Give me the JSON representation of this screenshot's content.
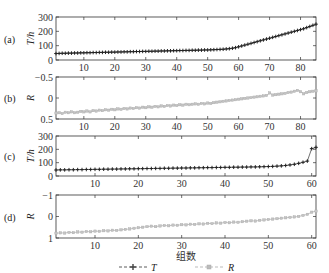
{
  "chart_data": [
    {
      "id": "a",
      "type": "line",
      "panel_label": "(a)",
      "ylabel": "T/h",
      "xlabel": "",
      "xlim": [
        1,
        85
      ],
      "ylim": [
        0,
        300
      ],
      "yticks": [
        "0",
        "100",
        "200",
        "300"
      ],
      "ytick_values": [
        0,
        100,
        200,
        300
      ],
      "xticks": [
        10,
        20,
        30,
        40,
        50,
        60,
        70,
        80
      ],
      "xtick_labels": [
        "10",
        "20",
        "30",
        "40",
        "50",
        "60",
        "70",
        "80"
      ],
      "series": [
        {
          "name": "T",
          "marker": "plus",
          "color": "#333333",
          "x_start": 1,
          "x_end": 85,
          "values": [
            45,
            46,
            47,
            47,
            48,
            48,
            49,
            49,
            50,
            50,
            51,
            51,
            52,
            52,
            53,
            53,
            54,
            54,
            55,
            55,
            56,
            56,
            57,
            57,
            58,
            58,
            59,
            59,
            60,
            60,
            61,
            61,
            62,
            62,
            63,
            63,
            64,
            64,
            65,
            65,
            66,
            66,
            67,
            67,
            68,
            68,
            69,
            69,
            70,
            70,
            71,
            72,
            73,
            74,
            75,
            77,
            79,
            82,
            86,
            92,
            98,
            104,
            110,
            116,
            122,
            128,
            134,
            140,
            146,
            152,
            158,
            164,
            170,
            176,
            182,
            188,
            194,
            200,
            206,
            212,
            218,
            226,
            234,
            242,
            250
          ]
        }
      ]
    },
    {
      "id": "b",
      "type": "line",
      "panel_label": "(b)",
      "ylabel": "R",
      "xlabel": "",
      "xlim": [
        1,
        85
      ],
      "ylim": [
        0.5,
        -0.5
      ],
      "yticks": [
        "−0.5",
        "0",
        "0.5"
      ],
      "ytick_values": [
        -0.5,
        0,
        0.5
      ],
      "xticks": [
        10,
        20,
        30,
        40,
        50,
        60,
        70,
        80
      ],
      "xtick_labels": [
        "10",
        "20",
        "30",
        "40",
        "50",
        "60",
        "70",
        "80"
      ],
      "series": [
        {
          "name": "R",
          "marker": "square",
          "color": "#aaaaaa",
          "x_start": 1,
          "x_end": 85,
          "values": [
            0.36,
            0.35,
            0.37,
            0.34,
            0.35,
            0.33,
            0.35,
            0.34,
            0.32,
            0.33,
            0.31,
            0.33,
            0.3,
            0.31,
            0.29,
            0.3,
            0.28,
            0.29,
            0.27,
            0.28,
            0.26,
            0.27,
            0.25,
            0.26,
            0.24,
            0.25,
            0.23,
            0.24,
            0.22,
            0.23,
            0.21,
            0.22,
            0.2,
            0.21,
            0.19,
            0.2,
            0.18,
            0.19,
            0.17,
            0.18,
            0.16,
            0.17,
            0.15,
            0.16,
            0.15,
            0.14,
            0.15,
            0.13,
            0.14,
            0.12,
            0.13,
            0.11,
            0.1,
            0.09,
            0.08,
            0.07,
            0.06,
            0.05,
            0.04,
            0.03,
            0.02,
            0.01,
            0.0,
            -0.01,
            -0.02,
            -0.03,
            -0.04,
            -0.05,
            -0.06,
            -0.12,
            -0.07,
            -0.08,
            -0.09,
            -0.1,
            -0.11,
            -0.13,
            -0.14,
            -0.16,
            -0.18,
            -0.15,
            -0.1,
            -0.13,
            -0.15,
            -0.16,
            -0.17
          ]
        }
      ]
    },
    {
      "id": "c",
      "type": "line",
      "panel_label": "(c)",
      "ylabel": "T/h",
      "xlabel": "",
      "xlim": [
        1,
        61
      ],
      "ylim": [
        0,
        300
      ],
      "yticks": [
        "0",
        "100",
        "200",
        "300"
      ],
      "ytick_values": [
        0,
        100,
        200,
        300
      ],
      "xticks": [
        10,
        20,
        30,
        40,
        50,
        60
      ],
      "xtick_labels": [
        "10",
        "20",
        "30",
        "40",
        "50",
        "60"
      ],
      "series": [
        {
          "name": "T",
          "marker": "plus",
          "color": "#333333",
          "x_start": 1,
          "x_end": 61,
          "values": [
            45,
            46,
            46,
            47,
            47,
            48,
            48,
            49,
            49,
            50,
            50,
            51,
            51,
            52,
            52,
            53,
            53,
            54,
            54,
            55,
            55,
            56,
            56,
            57,
            57,
            58,
            58,
            59,
            59,
            60,
            60,
            61,
            61,
            62,
            62,
            63,
            63,
            64,
            64,
            65,
            65,
            66,
            66,
            67,
            67,
            68,
            68,
            69,
            70,
            71,
            72,
            74,
            76,
            79,
            83,
            88,
            95,
            103,
            112,
            205,
            215
          ]
        }
      ]
    },
    {
      "id": "d",
      "type": "line",
      "panel_label": "(d)",
      "ylabel": "R",
      "xlabel": "组数",
      "xlim": [
        1,
        61
      ],
      "ylim": [
        1,
        -1
      ],
      "yticks": [
        "−1",
        "0",
        "1"
      ],
      "ytick_values": [
        -1,
        0,
        1
      ],
      "xticks": [
        10,
        20,
        30,
        40,
        50,
        60
      ],
      "xtick_labels": [
        "10",
        "20",
        "30",
        "40",
        "50",
        "60"
      ],
      "series": [
        {
          "name": "R",
          "marker": "square",
          "color": "#aaaaaa",
          "x_start": 1,
          "x_end": 61,
          "values": [
            0.78,
            0.76,
            0.77,
            0.74,
            0.75,
            0.72,
            0.73,
            0.7,
            0.71,
            0.68,
            0.69,
            0.66,
            0.67,
            0.64,
            0.65,
            0.62,
            0.6,
            0.58,
            0.55,
            0.52,
            0.5,
            0.47,
            0.45,
            0.47,
            0.44,
            0.42,
            0.43,
            0.4,
            0.41,
            0.38,
            0.39,
            0.36,
            0.37,
            0.34,
            0.35,
            0.32,
            0.33,
            0.3,
            0.31,
            0.28,
            0.29,
            0.26,
            0.27,
            0.24,
            0.22,
            0.2,
            0.21,
            0.18,
            0.16,
            0.14,
            0.12,
            0.1,
            0.08,
            0.06,
            0.04,
            0.02,
            0.0,
            -0.05,
            -0.1,
            -0.2,
            -0.25
          ]
        }
      ]
    }
  ],
  "legend": {
    "placement": "bottom-center",
    "items": [
      {
        "label": "T",
        "marker": "plus",
        "color": "#333333",
        "dash": "dashed"
      },
      {
        "label": "R",
        "marker": "square",
        "color": "#aaaaaa",
        "dash": "dashed"
      }
    ]
  }
}
